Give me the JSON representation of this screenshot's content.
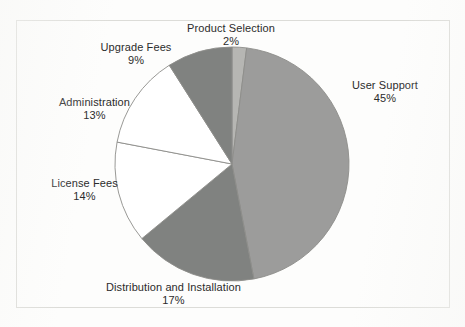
{
  "chart_data": {
    "type": "pie",
    "title": "",
    "subtitle": "",
    "xlabel": "",
    "ylabel": "",
    "legend_position": "none",
    "grid": false,
    "labels_show_percent": true,
    "categories": [
      "Product Selection",
      "User Support",
      "Distribution and Installation",
      "License Fees",
      "Administration",
      "Upgrade Fees"
    ],
    "values": [
      2,
      45,
      17,
      14,
      13,
      9
    ],
    "value_labels": [
      "2%",
      "45%",
      "17%",
      "14%",
      "13%",
      "9%"
    ],
    "colors": [
      "#b6b6b3",
      "#9c9c9b",
      "#808280",
      "#ffffff",
      "#ffffff",
      "#808280"
    ],
    "slices": [
      {
        "name": "Product Selection",
        "value": 2,
        "value_label": "2%",
        "color": "#b6b6b3",
        "start_angle_deg": 0,
        "end_angle_deg": 7.2
      },
      {
        "name": "User Support",
        "value": 45,
        "value_label": "45%",
        "color": "#9c9c9b",
        "start_angle_deg": 7.2,
        "end_angle_deg": 169.2
      },
      {
        "name": "Distribution and Installation",
        "value": 17,
        "value_label": "17%",
        "color": "#808280",
        "start_angle_deg": 169.2,
        "end_angle_deg": 230.4
      },
      {
        "name": "License Fees",
        "value": 14,
        "value_label": "14%",
        "color": "#ffffff",
        "start_angle_deg": 230.4,
        "end_angle_deg": 280.8
      },
      {
        "name": "Administration",
        "value": 13,
        "value_label": "13%",
        "color": "#ffffff",
        "start_angle_deg": 280.8,
        "end_angle_deg": 327.6
      },
      {
        "name": "Upgrade Fees",
        "value": 9,
        "value_label": "9%",
        "color": "#808280",
        "start_angle_deg": 327.6,
        "end_angle_deg": 360
      }
    ]
  },
  "labels": {
    "product_selection": {
      "name": "Product Selection",
      "pct": "2%"
    },
    "upgrade_fees": {
      "name": "Upgrade Fees",
      "pct": "9%"
    },
    "administration": {
      "name": "Administration",
      "pct": "13%"
    },
    "license_fees": {
      "name": "License Fees",
      "pct": "14%"
    },
    "distribution": {
      "name": "Distribution and Installation",
      "pct": "17%"
    },
    "user_support": {
      "name": "User Support",
      "pct": "45%"
    }
  },
  "style": {
    "frame_border_color": "#dcdcd8",
    "background_color": "#fdfdfc",
    "slice_outline_color": "#8d8d8a",
    "text_color": "#2b2b2b"
  }
}
